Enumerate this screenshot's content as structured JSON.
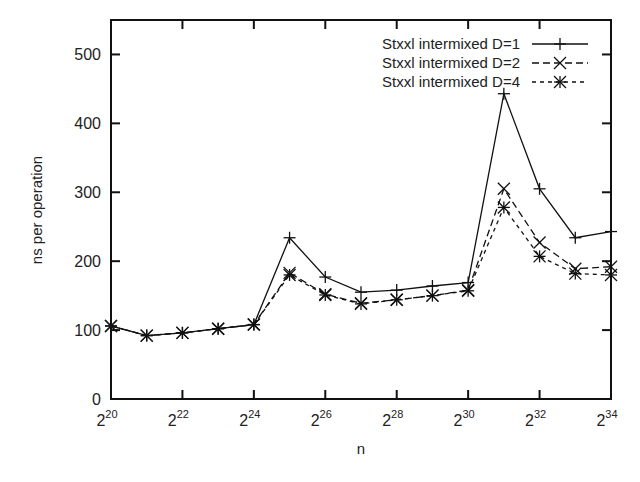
{
  "chart_data": {
    "type": "line",
    "title": "",
    "xlabel": "n",
    "ylabel": "ns per operation",
    "x_scale": "log2",
    "x": [
      20,
      21,
      22,
      23,
      24,
      25,
      26,
      27,
      28,
      29,
      30,
      31,
      32,
      33,
      34
    ],
    "x_ticks": [
      20,
      22,
      24,
      26,
      28,
      30,
      32,
      34
    ],
    "x_tick_labels": [
      "2^20",
      "2^22",
      "2^24",
      "2^26",
      "2^28",
      "2^30",
      "2^32",
      "2^34"
    ],
    "xlim": [
      20,
      34
    ],
    "y_ticks": [
      0,
      100,
      200,
      300,
      400,
      500
    ],
    "ylim": [
      0,
      550
    ],
    "grid": false,
    "legend_position": "top-right",
    "series": [
      {
        "name": "Stxxl intermixed D=1",
        "style": "solid",
        "marker": "plus",
        "values": [
          106,
          92,
          96,
          102,
          108,
          234,
          177,
          155,
          158,
          164,
          169,
          443,
          305,
          234,
          243
        ]
      },
      {
        "name": "Stxxl intermixed D=2",
        "style": "dashed",
        "marker": "x",
        "values": [
          106,
          92,
          96,
          102,
          108,
          183,
          152,
          139,
          144,
          150,
          158,
          305,
          227,
          189,
          192
        ]
      },
      {
        "name": "Stxxl intermixed D=4",
        "style": "dotted",
        "marker": "asterisk",
        "values": [
          106,
          92,
          96,
          102,
          108,
          180,
          151,
          138,
          144,
          150,
          157,
          278,
          207,
          182,
          180
        ]
      }
    ]
  }
}
